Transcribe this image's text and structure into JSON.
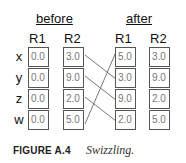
{
  "diagram": {
    "before": {
      "title": "before",
      "columns": [
        "R1",
        "R2"
      ],
      "R1": [
        "0.0",
        "0.0",
        "0.0",
        "0.0"
      ],
      "R2": [
        "3.0",
        "9.0",
        "2.0",
        "5.0"
      ]
    },
    "after": {
      "title": "after",
      "columns": [
        "R1",
        "R2"
      ],
      "R1": [
        "5.0",
        "3.0",
        "9.0",
        "2.0"
      ],
      "R2": [
        "3.0",
        "9.0",
        "2.0",
        "5.0"
      ]
    },
    "row_labels": [
      "x",
      "y",
      "z",
      "w"
    ],
    "connections": [
      {
        "from": "before.R2.x",
        "to": "after.R1.y"
      },
      {
        "from": "before.R2.y",
        "to": "after.R1.z"
      },
      {
        "from": "before.R2.z",
        "to": "after.R1.w"
      },
      {
        "from": "before.R2.w",
        "to": "after.R1.x"
      }
    ]
  },
  "caption": {
    "label": "FIGURE A.4",
    "text": "Swizzling."
  }
}
